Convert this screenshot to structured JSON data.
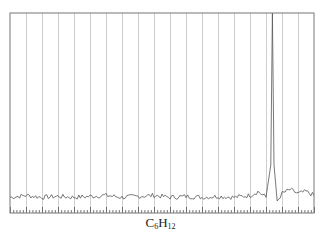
{
  "chart_data": {
    "type": "line",
    "title": "",
    "caption": {
      "element": "C",
      "sub1": "6",
      "element2": "H",
      "sub2": "12"
    },
    "caption_text": "C6H12",
    "xlabel": "",
    "ylabel": "",
    "x_tick_labels": [],
    "y_tick_labels": [],
    "grid": {
      "vertical": true,
      "horizontal": false,
      "vertical_count": 18
    },
    "minor_ticks_per_interval": 5,
    "legend": null,
    "xlim": [
      0,
      19
    ],
    "ylim": [
      0,
      1
    ],
    "series": [
      {
        "name": "spectrum",
        "description": "flat noisy baseline with a single sharp peak near x=16.4 (in gridline units)",
        "x": [
          0,
          1,
          2,
          3,
          4,
          5,
          6,
          7,
          8,
          9,
          10,
          11,
          12,
          13,
          14,
          15,
          15.5,
          16.0,
          16.3,
          16.4,
          16.5,
          16.7,
          17,
          17.5,
          18,
          18.5,
          19
        ],
        "values": [
          0.03,
          0.04,
          0.03,
          0.035,
          0.03,
          0.035,
          0.04,
          0.03,
          0.035,
          0.04,
          0.03,
          0.035,
          0.03,
          0.035,
          0.03,
          0.04,
          0.06,
          0.03,
          0.2,
          1.0,
          0.2,
          0.01,
          0.05,
          0.07,
          0.05,
          0.06,
          0.04
        ]
      }
    ],
    "peak": {
      "x": 16.4,
      "value": 1.0
    }
  },
  "colors": {
    "frame": "#777777",
    "grid": "#cfcfcf",
    "line": "#555555",
    "ticks": "#555555"
  },
  "plot_area": {
    "left": 10,
    "right": 314,
    "top": 13,
    "bottom": 213,
    "baseline": 203
  }
}
